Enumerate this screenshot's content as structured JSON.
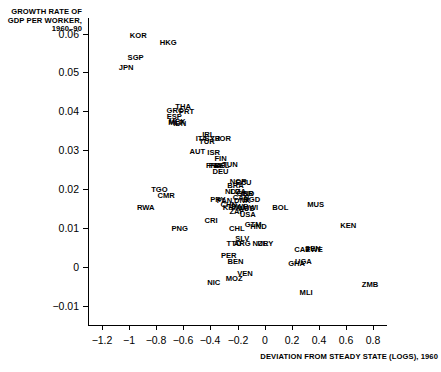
{
  "chart_data": {
    "type": "scatter",
    "title": "",
    "xlabel": "DEVIATION FROM STEADY STATE (LOGS), 1960",
    "ylabel": "GROWTH RATE OF GDP PER WORKER, 1960–90",
    "xlim": [
      -1.3,
      0.9
    ],
    "ylim": [
      -0.015,
      0.064
    ],
    "xticks": [
      -1.2,
      -1,
      -0.8,
      -0.6,
      -0.4,
      -0.2,
      0,
      0.2,
      0.4,
      0.6,
      0.8
    ],
    "xtick_labels": [
      "−1.2",
      "−1",
      "−0.8",
      "−0.6",
      "−0.4",
      "−0.2",
      "0",
      "0.2",
      "0.4",
      "0.6",
      "0.8"
    ],
    "yticks": [
      0.06,
      0.05,
      0.04,
      0.03,
      0.02,
      0.01,
      0,
      -0.01
    ],
    "ytick_labels": [
      "0.06",
      "0.05",
      "0.04",
      "0.03",
      "0.02",
      "0.01",
      "0",
      "−0.01"
    ],
    "grid": false,
    "legend": "none",
    "marker_style": "text-label",
    "points": [
      {
        "label": "KOR",
        "x": -0.93,
        "y": 0.0595
      },
      {
        "label": "HKG",
        "x": -0.71,
        "y": 0.0575
      },
      {
        "label": "SGP",
        "x": -0.95,
        "y": 0.0537
      },
      {
        "label": "JPN",
        "x": -1.02,
        "y": 0.0512
      },
      {
        "label": "THA",
        "x": -0.6,
        "y": 0.041
      },
      {
        "label": "GRC",
        "x": -0.66,
        "y": 0.04
      },
      {
        "label": "PRT",
        "x": -0.575,
        "y": 0.0398
      },
      {
        "label": "ESP",
        "x": -0.665,
        "y": 0.0385
      },
      {
        "label": "MEX",
        "x": -0.645,
        "y": 0.0372
      },
      {
        "label": "MLT",
        "x": -0.655,
        "y": 0.0369
      },
      {
        "label": "IDN",
        "x": -0.625,
        "y": 0.0367
      },
      {
        "label": "IRL",
        "x": -0.415,
        "y": 0.034
      },
      {
        "label": "ITA",
        "x": -0.465,
        "y": 0.0328
      },
      {
        "label": "TUR",
        "x": -0.425,
        "y": 0.032
      },
      {
        "label": "SYR",
        "x": -0.385,
        "y": 0.0328
      },
      {
        "label": "JOR",
        "x": -0.305,
        "y": 0.033
      },
      {
        "label": "AUT",
        "x": -0.495,
        "y": 0.0295
      },
      {
        "label": "ISR",
        "x": -0.375,
        "y": 0.0292
      },
      {
        "label": "FIN",
        "x": -0.325,
        "y": 0.0278
      },
      {
        "label": "TUN",
        "x": -0.255,
        "y": 0.0262
      },
      {
        "label": "BEL",
        "x": -0.315,
        "y": 0.0258
      },
      {
        "label": "FRA",
        "x": -0.375,
        "y": 0.026
      },
      {
        "label": "PAK",
        "x": -0.355,
        "y": 0.0258
      },
      {
        "label": "DEU",
        "x": -0.325,
        "y": 0.0243
      },
      {
        "label": "NOR",
        "x": -0.195,
        "y": 0.0218
      },
      {
        "label": "ECU",
        "x": -0.155,
        "y": 0.0216
      },
      {
        "label": "BRA",
        "x": -0.215,
        "y": 0.0208
      },
      {
        "label": "DZA",
        "x": -0.195,
        "y": 0.0192
      },
      {
        "label": "GBR",
        "x": -0.145,
        "y": 0.0188
      },
      {
        "label": "IND",
        "x": -0.125,
        "y": 0.0188
      },
      {
        "label": "NLD",
        "x": -0.235,
        "y": 0.0192
      },
      {
        "label": "CAN",
        "x": -0.175,
        "y": 0.0178
      },
      {
        "label": "BGD",
        "x": -0.095,
        "y": 0.0172
      },
      {
        "label": "TGO",
        "x": -0.775,
        "y": 0.0198
      },
      {
        "label": "CMR",
        "x": -0.725,
        "y": 0.0182
      },
      {
        "label": "DNK",
        "x": -0.165,
        "y": 0.0168
      },
      {
        "label": "PAN",
        "x": -0.295,
        "y": 0.0168
      },
      {
        "label": "CHN",
        "x": -0.265,
        "y": 0.0158
      },
      {
        "label": "SWE",
        "x": -0.185,
        "y": 0.0155
      },
      {
        "label": "KHM",
        "x": -0.245,
        "y": 0.0152
      },
      {
        "label": "AUS",
        "x": -0.135,
        "y": 0.0148
      },
      {
        "label": "MWI",
        "x": -0.105,
        "y": 0.015
      },
      {
        "label": "ZAF",
        "x": -0.205,
        "y": 0.014
      },
      {
        "label": "USA",
        "x": -0.125,
        "y": 0.0132
      },
      {
        "label": "PRY",
        "x": -0.345,
        "y": 0.0172
      },
      {
        "label": "RWA",
        "x": -0.875,
        "y": 0.015
      },
      {
        "label": "BOL",
        "x": 0.115,
        "y": 0.0152
      },
      {
        "label": "MUS",
        "x": 0.375,
        "y": 0.0158
      },
      {
        "label": "CRI",
        "x": -0.395,
        "y": 0.0118
      },
      {
        "label": "PNG",
        "x": -0.625,
        "y": 0.0098
      },
      {
        "label": "CHL",
        "x": -0.205,
        "y": 0.0098
      },
      {
        "label": "GTM",
        "x": -0.085,
        "y": 0.0108
      },
      {
        "label": "HND",
        "x": -0.045,
        "y": 0.0102
      },
      {
        "label": "KEN",
        "x": 0.615,
        "y": 0.0105
      },
      {
        "label": "SLV",
        "x": -0.165,
        "y": 0.0072
      },
      {
        "label": "TTO",
        "x": -0.225,
        "y": 0.0058
      },
      {
        "label": "ARG",
        "x": -0.165,
        "y": 0.0058
      },
      {
        "label": "NZL",
        "x": -0.035,
        "y": 0.0058
      },
      {
        "label": "URY",
        "x": 0.005,
        "y": 0.0058
      },
      {
        "label": "PER",
        "x": -0.265,
        "y": 0.0028
      },
      {
        "label": "CAF",
        "x": 0.275,
        "y": 0.0042
      },
      {
        "label": "SEN",
        "x": 0.355,
        "y": 0.0045
      },
      {
        "label": "ZWE",
        "x": 0.365,
        "y": 0.0042
      },
      {
        "label": "BEN",
        "x": -0.215,
        "y": 0.0012
      },
      {
        "label": "GHA",
        "x": 0.235,
        "y": 0.0008
      },
      {
        "label": "UGA",
        "x": 0.285,
        "y": 0.0012
      },
      {
        "label": "VEN",
        "x": -0.145,
        "y": -0.0018
      },
      {
        "label": "MOZ",
        "x": -0.225,
        "y": -0.0032
      },
      {
        "label": "NIC",
        "x": -0.375,
        "y": -0.0042
      },
      {
        "label": "MLI",
        "x": 0.305,
        "y": -0.0068
      },
      {
        "label": "ZMB",
        "x": 0.775,
        "y": -0.0048
      }
    ]
  }
}
